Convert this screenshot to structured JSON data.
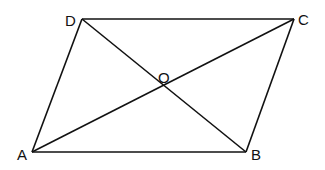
{
  "diagram": {
    "type": "geometry",
    "shape": "parallelogram",
    "points": {
      "A": {
        "label": "A",
        "x": 32,
        "y": 152
      },
      "B": {
        "label": "B",
        "x": 246,
        "y": 152
      },
      "C": {
        "label": "C",
        "x": 294,
        "y": 19
      },
      "D": {
        "label": "D",
        "x": 82,
        "y": 19
      },
      "O": {
        "label": "O",
        "x": 165,
        "y": 86
      }
    },
    "segments": [
      "AB",
      "BC",
      "CD",
      "DA",
      "AC",
      "BD"
    ],
    "labels": {
      "A": "A",
      "B": "B",
      "C": "C",
      "D": "D",
      "O": "O"
    },
    "stroke_color": "#111111"
  }
}
